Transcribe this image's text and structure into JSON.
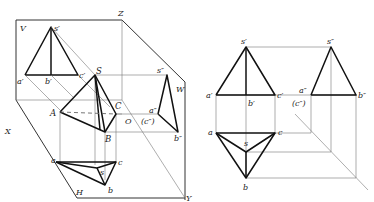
{
  "left_figure": {
    "name": "three-plane projection system (pictorial)",
    "planes": {
      "V": "V",
      "H": "H",
      "W": "W"
    },
    "axes": {
      "X": "X",
      "Y": "Y",
      "Z": "Z",
      "O": "O"
    },
    "space_points": {
      "S": "S",
      "A": "A",
      "B": "B",
      "C": "C"
    },
    "front_view_points": {
      "s": "s′",
      "a": "a′",
      "b": "b′",
      "c": "c′"
    },
    "top_view_points": {
      "s": "s",
      "a": "a",
      "b": "b",
      "c": "c"
    },
    "side_view_points": {
      "s": "s″",
      "a": "a″",
      "c": "(c″)",
      "b": "b″"
    }
  },
  "right_figure": {
    "name": "orthographic three views of triangular pyramid",
    "front_view_points": {
      "s": "s′",
      "a": "a′",
      "b": "b′",
      "c": "c′"
    },
    "side_view_points": {
      "s": "s″",
      "a": "a″",
      "c": "(c″)",
      "b": "b″"
    },
    "top_view_points": {
      "s": "s",
      "a": "a",
      "b": "b",
      "c": "c"
    }
  }
}
